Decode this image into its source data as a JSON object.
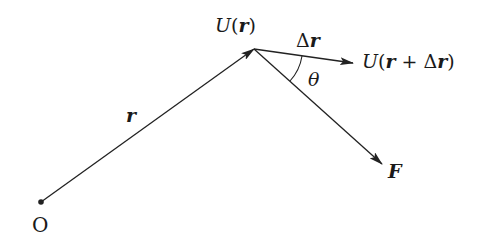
{
  "diagram": {
    "type": "vector-diagram",
    "colors": {
      "stroke": "#222222",
      "text": "#1a1a1a",
      "background": "#ffffff"
    },
    "points": {
      "origin": {
        "x": 41,
        "y": 202
      },
      "apex": {
        "x": 254,
        "y": 49
      },
      "delta_r_tip": {
        "x": 353,
        "y": 63
      },
      "force_tip": {
        "x": 382,
        "y": 164
      }
    },
    "labels": {
      "origin": "O",
      "position_vector": "r",
      "potential_at_r": {
        "func": "U",
        "open": "(",
        "arg": "r",
        "close": ")"
      },
      "displacement": {
        "delta": "Δ",
        "vec": "r"
      },
      "potential_at_r_plus_dr": {
        "func": "U",
        "open": "(",
        "arg1": "r",
        "plus": " + ",
        "delta": "Δ",
        "arg2": "r",
        "close": ")"
      },
      "angle": "θ",
      "force": "F"
    },
    "vectors": [
      {
        "name": "r",
        "from": "origin",
        "to": "apex"
      },
      {
        "name": "Δr",
        "from": "apex",
        "to": "delta_r_tip"
      },
      {
        "name": "F",
        "from": "apex",
        "to": "force_tip"
      }
    ]
  }
}
